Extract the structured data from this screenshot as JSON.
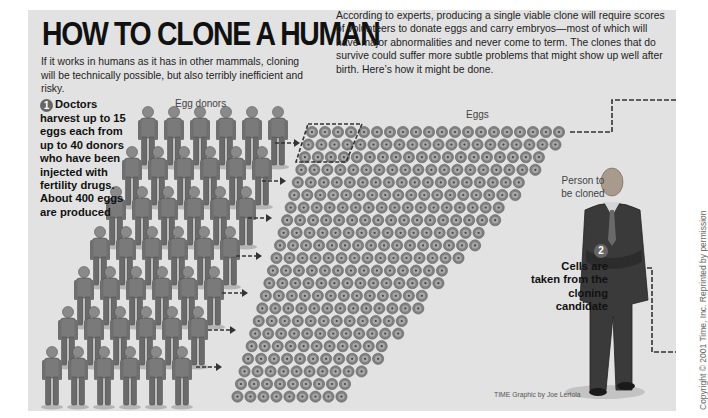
{
  "header": {
    "title": "HOW TO CLONE A HUMAN",
    "subtitle": "If it works in humans as it has in other mammals, cloning will be technically possible, but also terribly inefficient and risky.",
    "intro": "According to experts, producing a single viable clone will require scores of volunteers to donate eggs and carry embryos—most of which will have major abnormalities and never come to term. The clones that do survive could suffer more subtle problems that might show up well after birth. Here’s how it might be done."
  },
  "steps": [
    {
      "number": "1",
      "text": "Doctors harvest up to 15 eggs each from up to 40 donors who have been injected with fertility drugs. About 400 eggs are produced"
    },
    {
      "number": "2",
      "text": "Cells are taken from the cloning candidate"
    }
  ],
  "labels": {
    "egg_donors": "Egg donors",
    "eggs": "Eggs",
    "person_to_be_cloned": "Person to be cloned"
  },
  "figures": {
    "donor_rows": 5,
    "donors_per_row": 6,
    "egg_rows": 22,
    "eggs_per_row": 20
  },
  "colors": {
    "panel": "#e2e2e2",
    "egg": "#808080",
    "egg_ring": "#a8a8a8",
    "figure": "#7a7a7a",
    "dashes": "#333333",
    "suit": "#3a3a3a"
  },
  "footer": {
    "credit": "TIME Graphic by Joe Lertola",
    "copyright": "Copyright © 2001 Time, Inc. Reprinted by permission"
  }
}
